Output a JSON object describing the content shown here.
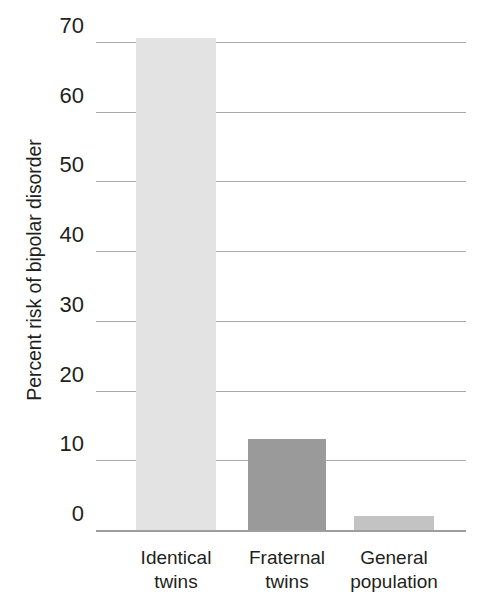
{
  "chart_data": {
    "type": "bar",
    "title": "",
    "subtitle": "",
    "xlabel": "",
    "ylabel": "Percent risk of bipolar disorder",
    "categories": [
      "Identical twins",
      "Fraternal twins",
      "General population"
    ],
    "category_lines": [
      [
        "Identical",
        "twins"
      ],
      [
        "Fraternal",
        "twins"
      ],
      [
        "General",
        "population"
      ]
    ],
    "values": [
      70.5,
      13,
      2
    ],
    "value_unit": "percent",
    "ylim": [
      0,
      70
    ],
    "y_ticks": [
      0,
      10,
      20,
      30,
      40,
      50,
      60,
      70
    ],
    "y_tick_labels": [
      "0",
      "10",
      "20",
      "30",
      "40",
      "50",
      "60",
      "70"
    ],
    "grid": true,
    "grid_axis": "y",
    "legend": false,
    "legend_position": "none",
    "bar_colors": [
      "#e3e3e3",
      "#9a9a9a",
      "#c3c3c3"
    ],
    "colors": {
      "background": "#ffffff",
      "gridline": "#a8a8a8",
      "baseline": "#9d9d9d",
      "text": "#231f20",
      "bar_light": "#e3e3e3",
      "bar_medium": "#9a9a9a",
      "bar_general": "#c3c3c3"
    }
  }
}
